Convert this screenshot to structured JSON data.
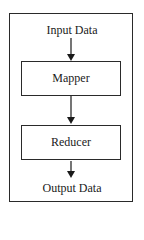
{
  "diagram": {
    "input_label": "Input Data",
    "stages": [
      {
        "label": "Mapper"
      },
      {
        "label": "Reducer"
      }
    ],
    "output_label": "Output Data"
  }
}
